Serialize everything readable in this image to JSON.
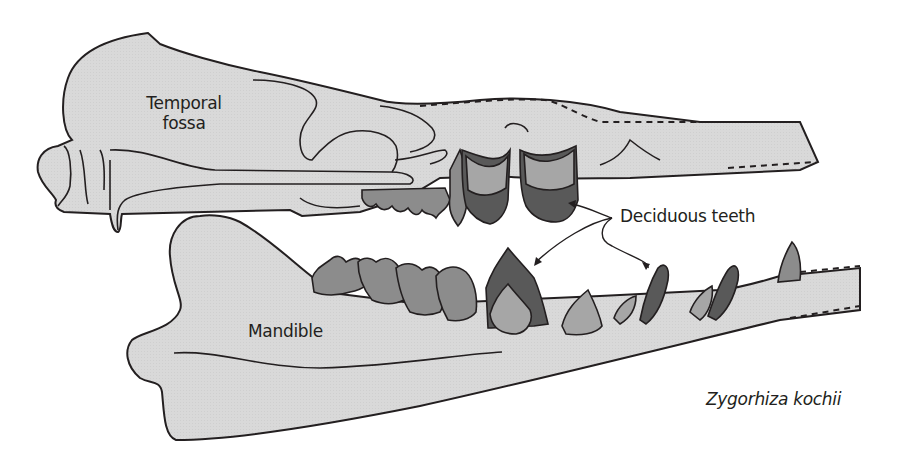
{
  "diagram": {
    "species": "Zygorhiza kochii",
    "labels": {
      "temporal_fossa_line1": "Temporal",
      "temporal_fossa_line2": "fossa",
      "mandible": "Mandible",
      "deciduous_teeth": "Deciduous teeth"
    },
    "colors": {
      "bone_fill": "#d9d9d9",
      "outline": "#231f20",
      "tooth_light": "#a6a6a6",
      "tooth_mid": "#8c8c8c",
      "tooth_dark": "#595959"
    }
  }
}
